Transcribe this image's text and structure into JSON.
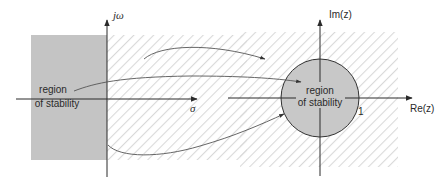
{
  "diagram": {
    "s_plane": {
      "vertical_axis_label": "jω",
      "horizontal_axis_label": "σ",
      "region_label_line1": "region",
      "region_label_line2": "of stability",
      "region_fill": "#c4c4c4"
    },
    "z_plane": {
      "vertical_axis_label": "Im(z)",
      "horizontal_axis_label": "Re(z)",
      "unit_marker": "1",
      "region_label_line1": "region",
      "region_label_line2": "of stability",
      "region_fill": "#c8c8c8"
    },
    "colors": {
      "axis": "#2a2a2a",
      "hatch": "#dcdcdc",
      "curve": "#555555"
    },
    "mappings": [
      {
        "from": "right half-plane (upper)",
        "to": "outside unit circle"
      },
      {
        "from": "left half-plane",
        "to": "inside unit circle"
      },
      {
        "from": "imaginary axis",
        "to": "unit circle"
      }
    ]
  }
}
